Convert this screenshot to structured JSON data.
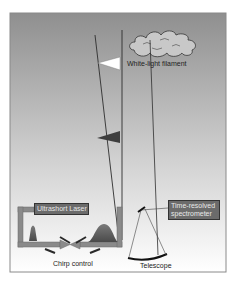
{
  "diagram": {
    "type": "teramobile-lidar-schematic",
    "labels": {
      "filament": "White-light filament",
      "laser": "Ultrashort Laser",
      "spectrometer_line1": "Time-resolved",
      "spectrometer_line2": "spectrometer",
      "chirp": "Chirp control",
      "telescope": "Telescope"
    },
    "colors": {
      "sky_top": "#9a9a9a",
      "sky_bottom": "#ffffff",
      "beam": "#3a3a3a",
      "box_fill": "#6b6b6b",
      "pulse_fill": "#5a5a5a",
      "cloud_fill": "#c8c8c8",
      "frame": "#8a8a8a"
    },
    "icons": [
      "cloud-icon",
      "white-light-flag-icon",
      "dark-pulse-flag-icon",
      "short-pulse-icon",
      "chirped-pulse-icon",
      "telescope-mirror-icon",
      "grating-icon"
    ]
  }
}
